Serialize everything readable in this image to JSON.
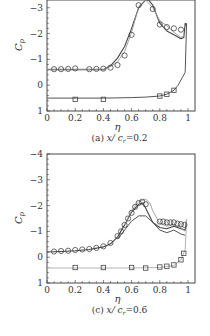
{
  "chart_data": [
    {
      "type": "line",
      "panel": "a",
      "title": "(a) x/c_r=0.2",
      "caption": "(a) x/ c",
      "caption_sub": "r",
      "caption_tail": "=0.2",
      "xlabel": "η",
      "ylabel": "C",
      "ylabel_sub": "p",
      "xlim": [
        0,
        1
      ],
      "ylim": [
        1,
        -3.3
      ],
      "y_inverted": true,
      "xticks": [
        "0",
        "0.2",
        "0.4",
        "0.6",
        "0.8",
        "1"
      ],
      "yticks": [
        "-3",
        "-2",
        "-1",
        "0",
        "1"
      ],
      "ytick_values": [
        -3,
        -2,
        -1,
        0,
        1
      ],
      "series": [
        {
          "name": "upper surface experiment (circles)",
          "marker": "circle",
          "x": [
            0.05,
            0.1,
            0.15,
            0.2,
            0.3,
            0.35,
            0.4,
            0.45,
            0.5,
            0.55,
            0.6,
            0.65,
            0.75,
            0.8,
            0.85,
            0.9,
            0.95
          ],
          "y": [
            -0.62,
            -0.62,
            -0.63,
            -0.65,
            -0.62,
            -0.63,
            -0.64,
            -0.68,
            -0.78,
            -1.15,
            -1.95,
            -3.1,
            -2.95,
            -2.35,
            -2.25,
            -2.2,
            -2.15
          ]
        },
        {
          "name": "lower surface experiment (squares)",
          "marker": "square",
          "x": [
            0.2,
            0.4,
            0.8,
            0.85,
            0.9
          ],
          "y": [
            0.55,
            0.55,
            0.42,
            0.35,
            0.2
          ]
        },
        {
          "name": "computation 1 (dark line)",
          "marker": "none",
          "x": [
            0.0,
            0.1,
            0.2,
            0.3,
            0.4,
            0.45,
            0.5,
            0.55,
            0.6,
            0.65,
            0.7,
            0.72,
            0.75,
            0.8,
            0.85,
            0.9,
            0.95,
            0.97,
            0.98,
            0.99
          ],
          "y": [
            -0.6,
            -0.6,
            -0.6,
            -0.6,
            -0.6,
            -0.75,
            -1.05,
            -1.5,
            -2.2,
            -3.0,
            -3.3,
            -3.3,
            -3.1,
            -2.4,
            -2.1,
            -1.95,
            -1.8,
            -1.85,
            -2.4,
            -2.3
          ]
        },
        {
          "name": "computation 2 (grey line)",
          "marker": "none",
          "x": [
            0.0,
            0.2,
            0.4,
            0.45,
            0.5,
            0.55,
            0.6,
            0.65,
            0.7,
            0.75,
            0.8,
            0.85,
            0.9,
            0.95,
            0.97
          ],
          "y": [
            -0.62,
            -0.62,
            -0.62,
            -0.72,
            -0.9,
            -1.3,
            -2.05,
            -3.05,
            -3.3,
            -3.0,
            -2.5,
            -2.3,
            -2.05,
            -1.85,
            -1.9
          ]
        },
        {
          "name": "lower surface computation",
          "marker": "none",
          "x": [
            0.0,
            0.2,
            0.4,
            0.6,
            0.7,
            0.8,
            0.85,
            0.9,
            0.93,
            0.96,
            0.98,
            0.99
          ],
          "y": [
            0.5,
            0.5,
            0.5,
            0.48,
            0.46,
            0.42,
            0.35,
            0.2,
            0.0,
            -0.3,
            -0.5,
            -2.4
          ]
        }
      ]
    },
    {
      "type": "line",
      "panel": "c",
      "title": "(c) x/c_r=0.6",
      "caption": "(c) x/ c",
      "caption_sub": "r",
      "caption_tail": "=0.6",
      "xlabel": "η",
      "ylabel": "C",
      "ylabel_sub": "p",
      "xlim": [
        0,
        1
      ],
      "ylim": [
        1,
        -4
      ],
      "y_inverted": true,
      "xticks": [
        "0",
        "0.2",
        "0.4",
        "0.6",
        "0.8",
        "1"
      ],
      "yticks": [
        "-4",
        "-3",
        "-2",
        "-1",
        "0",
        "1"
      ],
      "ytick_values": [
        -4,
        -3,
        -2,
        -1,
        0,
        1
      ],
      "series": [
        {
          "name": "upper surface experiment (circles)",
          "marker": "circle",
          "x": [
            0.05,
            0.1,
            0.15,
            0.2,
            0.25,
            0.3,
            0.35,
            0.4,
            0.45,
            0.5,
            0.525,
            0.55,
            0.575,
            0.6,
            0.625,
            0.65,
            0.675,
            0.7,
            0.8,
            0.825,
            0.85,
            0.875,
            0.9,
            0.925,
            0.95,
            0.975
          ],
          "y": [
            -0.22,
            -0.24,
            -0.25,
            -0.28,
            -0.3,
            -0.32,
            -0.36,
            -0.42,
            -0.55,
            -0.82,
            -1.0,
            -1.25,
            -1.5,
            -1.72,
            -1.95,
            -2.1,
            -2.15,
            -2.05,
            -1.38,
            -1.38,
            -1.35,
            -1.35,
            -1.35,
            -1.3,
            -1.28,
            -1.25
          ]
        },
        {
          "name": "lower surface experiment (squares)",
          "marker": "square",
          "x": [
            0.2,
            0.4,
            0.6,
            0.7,
            0.8,
            0.85,
            0.9,
            0.95,
            0.97
          ],
          "y": [
            0.4,
            0.4,
            0.4,
            0.42,
            0.38,
            0.35,
            0.3,
            0.1,
            -0.15
          ]
        },
        {
          "name": "computation 1 (dark line)",
          "marker": "none",
          "x": [
            0.0,
            0.1,
            0.2,
            0.3,
            0.4,
            0.45,
            0.5,
            0.55,
            0.6,
            0.65,
            0.68,
            0.7,
            0.75,
            0.8,
            0.85,
            0.9,
            0.95,
            0.98,
            0.99
          ],
          "y": [
            -0.2,
            -0.22,
            -0.25,
            -0.3,
            -0.4,
            -0.52,
            -0.78,
            -1.25,
            -1.75,
            -2.05,
            -2.1,
            -1.9,
            -1.35,
            -1.15,
            -1.1,
            -1.2,
            -1.1,
            -1.05,
            -1.45
          ]
        },
        {
          "name": "computation 2 (light grey, high peak)",
          "marker": "none",
          "x": [
            0.55,
            0.6,
            0.65,
            0.7,
            0.73,
            0.75,
            0.8,
            0.85,
            0.9,
            0.95,
            0.98
          ],
          "y": [
            -1.25,
            -1.8,
            -2.15,
            -2.25,
            -2.1,
            -1.8,
            -1.3,
            -1.2,
            -1.25,
            -1.15,
            -1.0
          ]
        },
        {
          "name": "computation 3 (light grey, low peak)",
          "marker": "none",
          "x": [
            0.5,
            0.55,
            0.6,
            0.65,
            0.7,
            0.75,
            0.8,
            0.85,
            0.9,
            0.95,
            0.98
          ],
          "y": [
            -0.7,
            -1.05,
            -1.4,
            -1.6,
            -1.6,
            -1.35,
            -1.05,
            -0.95,
            -1.05,
            -0.9,
            -0.85
          ]
        },
        {
          "name": "lower surface computation",
          "marker": "none",
          "x": [
            0.0,
            0.2,
            0.4,
            0.6,
            0.8,
            0.9,
            0.95,
            0.98,
            0.99
          ],
          "y": [
            0.42,
            0.42,
            0.42,
            0.42,
            0.4,
            0.32,
            0.1,
            -0.3,
            -1.45
          ]
        }
      ]
    }
  ]
}
